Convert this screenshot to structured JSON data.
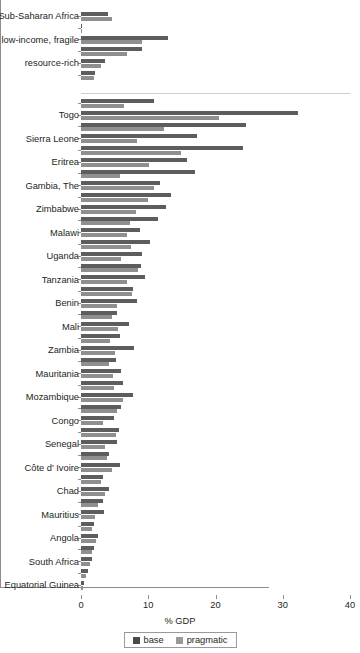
{
  "chart_data": {
    "type": "bar",
    "orientation": "horizontal",
    "title": "",
    "xlabel": "% GDP",
    "ylabel": "",
    "xlim": [
      0,
      40
    ],
    "xticks": [
      0,
      10,
      20,
      30,
      40
    ],
    "grid": false,
    "legend_position": "bottom",
    "legend": [
      "base",
      "pragmatic"
    ],
    "series": [
      {
        "name": "base",
        "color": "#5d5d5d"
      },
      {
        "name": "pragmatic",
        "color": "#8f8f8f"
      }
    ],
    "groups": [
      {
        "label": "Sub-Saharan Africa",
        "base": 4.0,
        "pragmatic": 4.6
      },
      {
        "label": "",
        "base": 0.0,
        "pragmatic": 0.0
      },
      {
        "label": "low-income, fragile",
        "base": 12.9,
        "pragmatic": 9.1
      },
      {
        "label": "",
        "base": 9.1,
        "pragmatic": 6.9
      },
      {
        "label": "resource-rich",
        "base": 3.6,
        "pragmatic": 2.9
      },
      {
        "label": "",
        "base": 2.1,
        "pragmatic": 1.9
      }
    ],
    "categories": [
      "Togo",
      "Sierra Leone",
      "Eritrea",
      "Gambia, The",
      "Zimbabwe",
      "Malawi",
      "Uganda",
      "Tanzania",
      "Benin",
      "Mali",
      "Zambia",
      "Mauritania",
      "Mozambique",
      "Congo",
      "Senegal",
      "Côte d' Ivoire",
      "Chad",
      "Mauritius",
      "Angola",
      "South Africa",
      "Equatorial Guinea"
    ],
    "rows": [
      {
        "label": "",
        "base": 10.8,
        "pragmatic": 6.4
      },
      {
        "label": "Togo",
        "base": 32.2,
        "pragmatic": 20.5
      },
      {
        "label": "",
        "base": 24.5,
        "pragmatic": 12.4
      },
      {
        "label": "Sierra Leone",
        "base": 17.3,
        "pragmatic": 8.4
      },
      {
        "label": "",
        "base": 24.1,
        "pragmatic": 14.9
      },
      {
        "label": "Eritrea",
        "base": 15.7,
        "pragmatic": 10.1
      },
      {
        "label": "",
        "base": 17.0,
        "pragmatic": 5.8
      },
      {
        "label": "Gambia, The",
        "base": 11.7,
        "pragmatic": 10.9
      },
      {
        "label": "",
        "base": 13.4,
        "pragmatic": 9.9
      },
      {
        "label": "Zimbabwe",
        "base": 12.7,
        "pragmatic": 8.2
      },
      {
        "label": "",
        "base": 11.4,
        "pragmatic": 7.3
      },
      {
        "label": "Malawi",
        "base": 8.7,
        "pragmatic": 6.8
      },
      {
        "label": "",
        "base": 10.2,
        "pragmatic": 7.4
      },
      {
        "label": "Uganda",
        "base": 9.0,
        "pragmatic": 5.9
      },
      {
        "label": "",
        "base": 8.9,
        "pragmatic": 8.5
      },
      {
        "label": "Tanzania",
        "base": 9.5,
        "pragmatic": 6.9
      },
      {
        "label": "",
        "base": 7.8,
        "pragmatic": 7.6
      },
      {
        "label": "Benin",
        "base": 8.3,
        "pragmatic": 5.3
      },
      {
        "label": "",
        "base": 5.4,
        "pragmatic": 4.6
      },
      {
        "label": "Mali",
        "base": 7.2,
        "pragmatic": 5.5
      },
      {
        "label": "",
        "base": 5.8,
        "pragmatic": 4.3
      },
      {
        "label": "Zambia",
        "base": 7.9,
        "pragmatic": 5.1
      },
      {
        "label": "",
        "base": 5.2,
        "pragmatic": 4.2
      },
      {
        "label": "Mauritania",
        "base": 5.9,
        "pragmatic": 4.8
      },
      {
        "label": "",
        "base": 6.3,
        "pragmatic": 4.9
      },
      {
        "label": "Mozambique",
        "base": 7.8,
        "pragmatic": 6.2
      },
      {
        "label": "",
        "base": 5.9,
        "pragmatic": 5.4
      },
      {
        "label": "Congo",
        "base": 4.9,
        "pragmatic": 3.3
      },
      {
        "label": "",
        "base": 5.6,
        "pragmatic": 5.2
      },
      {
        "label": "Senegal",
        "base": 5.3,
        "pragmatic": 3.6
      },
      {
        "label": "",
        "base": 4.1,
        "pragmatic": 3.9
      },
      {
        "label": "Côte d' Ivoire",
        "base": 5.8,
        "pragmatic": 4.6
      },
      {
        "label": "",
        "base": 3.2,
        "pragmatic": 3.0
      },
      {
        "label": "Chad",
        "base": 4.1,
        "pragmatic": 3.5
      },
      {
        "label": "",
        "base": 3.3,
        "pragmatic": 2.6
      },
      {
        "label": "Mauritius",
        "base": 3.4,
        "pragmatic": 2.1
      },
      {
        "label": "",
        "base": 1.9,
        "pragmatic": 1.7
      },
      {
        "label": "Angola",
        "base": 2.6,
        "pragmatic": 2.3
      },
      {
        "label": "",
        "base": 1.9,
        "pragmatic": 1.7
      },
      {
        "label": "South Africa",
        "base": 1.7,
        "pragmatic": 1.4
      },
      {
        "label": "",
        "base": 1.1,
        "pragmatic": 0.8
      },
      {
        "label": "Equatorial Guinea",
        "base": 0.4,
        "pragmatic": 0.3
      }
    ]
  },
  "axis": {
    "x_tick_labels": [
      "0",
      "10",
      "20",
      "30",
      "40"
    ],
    "x_title": "% GDP"
  },
  "legend": {
    "items": [
      {
        "label": "base",
        "swatch": "base-swatch-icon"
      },
      {
        "label": "pragmatic",
        "swatch": "pragmatic-swatch-icon"
      }
    ]
  }
}
